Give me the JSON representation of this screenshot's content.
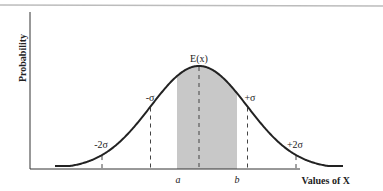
{
  "chart_data": {
    "type": "line",
    "title": "",
    "xlabel": "Values of X",
    "ylabel": "Probability",
    "mean_label": "E(x)",
    "sigma_markers": [
      {
        "label": "-2σ",
        "offset": -2
      },
      {
        "label": "-σ",
        "offset": -1
      },
      {
        "label": "+σ",
        "offset": 1
      },
      {
        "label": "+2σ",
        "offset": 2
      }
    ],
    "shaded_region": {
      "from_label": "a",
      "to_label": "b",
      "color": "#c8c8c8"
    },
    "x_tick_labels": [
      "a",
      "b"
    ],
    "grid": false,
    "legend": null
  },
  "labels": {
    "ylabel": "Probability",
    "xlabel": "Values of X",
    "mean": "E(x)",
    "minus_sigma": "-σ",
    "plus_sigma": "+σ",
    "minus_2sigma": "-2σ",
    "plus_2sigma": "+2σ",
    "a": "a",
    "b": "b"
  },
  "colors": {
    "curve": "#222222",
    "axes": "#333333",
    "shade": "#c8c8c8",
    "dashed": "#444444",
    "top_rule": "#bbbbbb"
  }
}
